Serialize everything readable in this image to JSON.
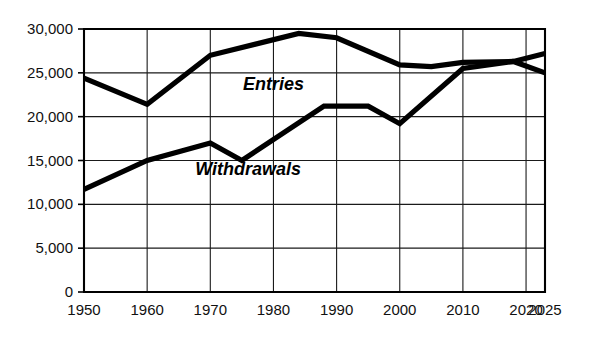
{
  "chart_data": {
    "type": "line",
    "title": "",
    "subtitle": "",
    "xlabel": "",
    "ylabel": "",
    "xlim": [
      1950,
      2025
    ],
    "ylim": [
      0,
      30000
    ],
    "grid": true,
    "legend": "inline-annotations",
    "x_ticks": [
      1950,
      1960,
      1970,
      1980,
      1990,
      2000,
      2010,
      2020,
      2025
    ],
    "x_tick_labels": [
      "1950",
      "1960",
      "1970",
      "1980",
      "1990",
      "2000",
      "2010",
      "2020",
      "2025"
    ],
    "y_ticks": [
      0,
      5000,
      10000,
      15000,
      20000,
      25000,
      30000
    ],
    "y_tick_labels": [
      "0",
      "5,000",
      "10,000",
      "15,000",
      "20,000",
      "25,000",
      "30,000"
    ],
    "series": [
      {
        "name": "Entries",
        "label": "Entries",
        "color": "#000000",
        "points": [
          [
            1950,
            24400
          ],
          [
            1960,
            21400
          ],
          [
            1970,
            27000
          ],
          [
            1984,
            29500
          ],
          [
            1990,
            29000
          ],
          [
            2000,
            25900
          ],
          [
            2005,
            25700
          ],
          [
            2010,
            26200
          ],
          [
            2018,
            26300
          ],
          [
            2025,
            25000
          ]
        ]
      },
      {
        "name": "Withdrawals",
        "label": "Withdrawals",
        "color": "#000000",
        "points": [
          [
            1950,
            11700
          ],
          [
            1960,
            15000
          ],
          [
            1970,
            17000
          ],
          [
            1975,
            15000
          ],
          [
            1988,
            21200
          ],
          [
            1995,
            21200
          ],
          [
            2000,
            19200
          ],
          [
            2010,
            25500
          ],
          [
            2018,
            26300
          ],
          [
            2025,
            27200
          ]
        ]
      }
    ],
    "annotations": [
      {
        "text": "Entries",
        "x": 1980,
        "y": 23000,
        "name": "entries-label"
      },
      {
        "text": "Withdrawals",
        "x": 1976,
        "y": 13400,
        "name": "withdrawals-label"
      }
    ]
  }
}
